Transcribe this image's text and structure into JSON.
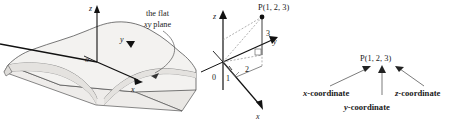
{
  "figure": {
    "type": "math-textbook-diagram",
    "panels": [
      {
        "id": "surface-panel",
        "name": "3D slab with coordinate axes",
        "annotation_line1": "the flat",
        "annotation_line2_italic": "xy",
        "annotation_line2_rest": " plane",
        "axis_labels": {
          "z": "z",
          "y": "y",
          "x": "x",
          "origin": "o"
        }
      },
      {
        "id": "coordinate-panel",
        "name": "3D axes with point P",
        "point_label": "P(1, 2, 3)",
        "axis_labels": {
          "z": "z",
          "y": "y",
          "x": "x"
        },
        "tick_labels": {
          "origin": "0",
          "x_value": "1",
          "y_value": "2",
          "z_value": "3"
        }
      },
      {
        "id": "callout-panel",
        "name": "coordinate name callouts",
        "point_label": "P(1, 2, 3)",
        "callouts": [
          {
            "italic": "x",
            "rest": "-coordinate"
          },
          {
            "italic": "y",
            "rest": "-coordinate"
          },
          {
            "italic": "z",
            "rest": "-coordinate"
          }
        ]
      }
    ]
  },
  "colors": {
    "ink": "#1a1a1a",
    "line": "#555555",
    "surface_fill": "#f1f0ee",
    "surface_fill_dark": "#e3e1de",
    "dashed": "#9a9a9a",
    "background": "#ffffff"
  }
}
